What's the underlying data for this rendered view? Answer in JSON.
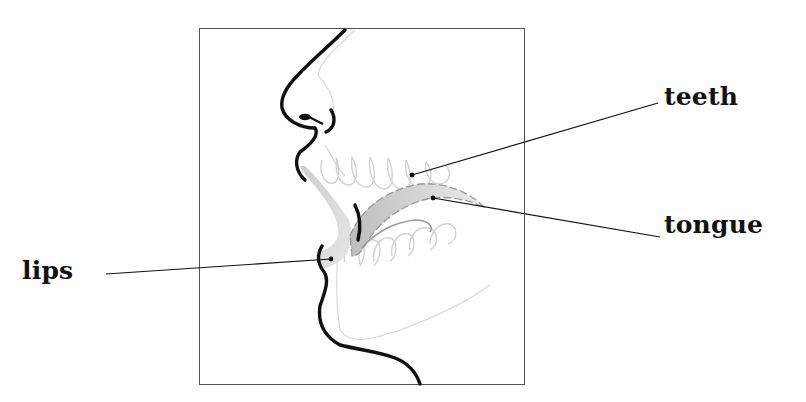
{
  "diagram": {
    "labels": [
      {
        "id": "teeth",
        "text": "teeth"
      },
      {
        "id": "tongue",
        "text": "tongue"
      },
      {
        "id": "lips",
        "text": "lips"
      }
    ],
    "colors": {
      "outline": "#111111",
      "frame": "#555555",
      "faint_anatomy": "#d6d6d6",
      "tongue_fill": "#cfcfcf",
      "leader_line": "#111111"
    }
  }
}
